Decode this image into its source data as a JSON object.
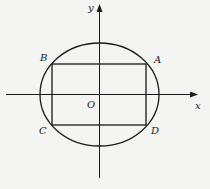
{
  "diagram": {
    "type": "ellipse-inscribed-rectangle",
    "stroke_color": "#1a1a1a",
    "background_color": "#f4f4f2",
    "axes": {
      "x_label": "x",
      "y_label": "y",
      "origin_label": "O"
    },
    "points": {
      "A": "A",
      "B": "B",
      "C": "C",
      "D": "D"
    },
    "shapes": {
      "ellipse": {
        "cx": 99.5,
        "cy": 94.5,
        "rx": 59.5,
        "ry": 51.5
      },
      "rectangle": {
        "x1": 52,
        "y1": 64,
        "x2": 146,
        "y2": 125,
        "vertices_order": [
          "A",
          "B",
          "C",
          "D"
        ]
      }
    }
  }
}
